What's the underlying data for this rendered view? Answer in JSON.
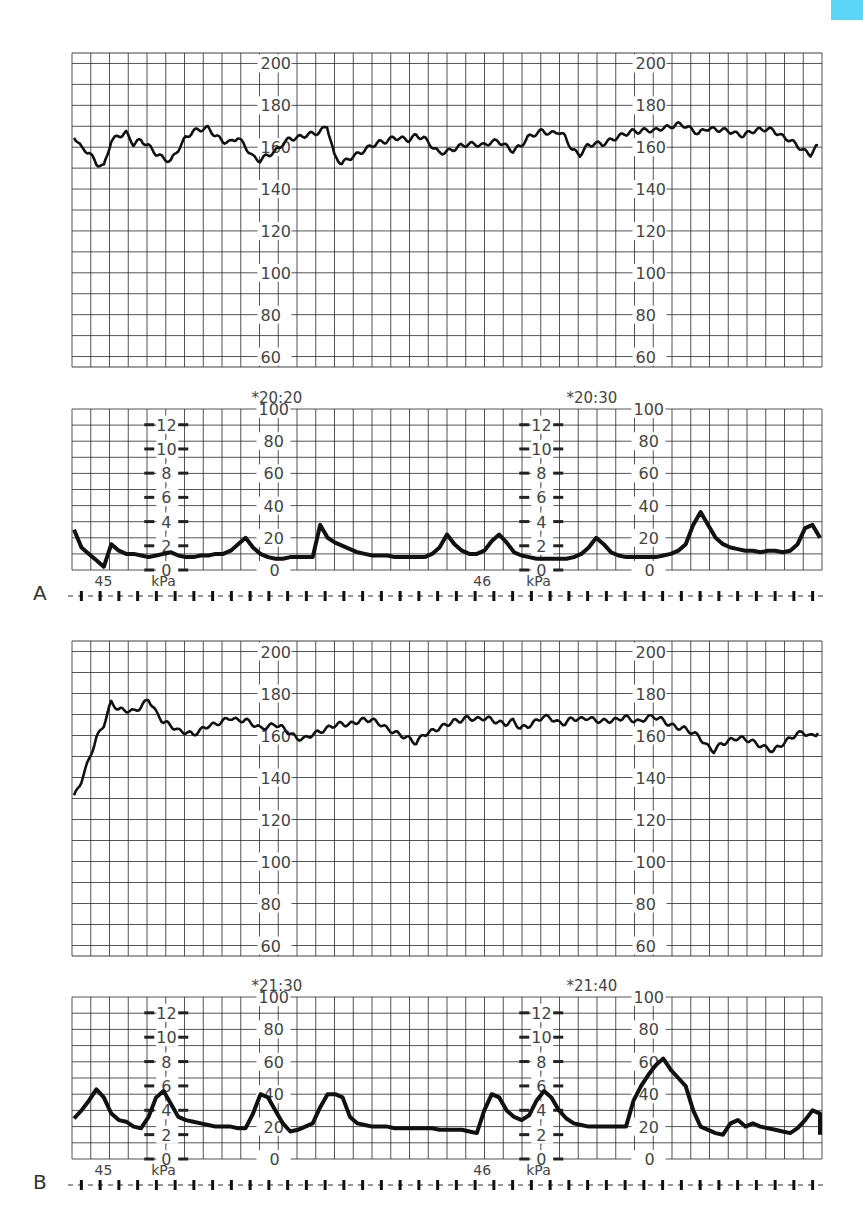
{
  "page": {
    "accent_tab_color": "#5ad5f5",
    "top_text": "",
    "grid_color": "#2a2a2a",
    "trace_color": "#111111",
    "label_color": "#444444"
  },
  "chart_data": [
    {
      "type": "line",
      "panel": "A",
      "title": "Panel A – Fetal heart rate (FHR)",
      "ylabel": "bpm",
      "ylim": [
        55,
        205
      ],
      "y_ticks": [
        200,
        180,
        160,
        140,
        120,
        100,
        80,
        60
      ],
      "grid": true,
      "x_domain": [
        0,
        100
      ],
      "series": [
        {
          "name": "FHR",
          "x": [
            0,
            1,
            2,
            3,
            4,
            5,
            6,
            7,
            8,
            9,
            10,
            11,
            12,
            13,
            14,
            15,
            16,
            17,
            18,
            19,
            20,
            21,
            22,
            23,
            24,
            25,
            26,
            27,
            28,
            29,
            30,
            31,
            32,
            33,
            34,
            35,
            36,
            37,
            38,
            39,
            40,
            41,
            42,
            43,
            44,
            45,
            46,
            47,
            48,
            49,
            50,
            51,
            52,
            53,
            54,
            55,
            56,
            57,
            58,
            59,
            60,
            61,
            62,
            63,
            64,
            65,
            66,
            67,
            68,
            69,
            70,
            71,
            72,
            73,
            74,
            75,
            76,
            77,
            78,
            79,
            80,
            81,
            82,
            83,
            84,
            85,
            86,
            87,
            88,
            89,
            90,
            91,
            92,
            93,
            94,
            95,
            96,
            97,
            98,
            99,
            100
          ],
          "values": [
            164,
            158,
            156,
            151,
            150,
            163,
            166,
            168,
            163,
            165,
            162,
            158,
            155,
            153,
            158,
            163,
            166,
            167,
            168,
            165,
            163,
            163,
            166,
            162,
            157,
            155,
            157,
            158,
            161,
            163,
            163,
            164,
            165,
            166,
            170,
            156,
            153,
            156,
            158,
            160,
            162,
            163,
            163,
            164,
            163,
            162,
            164,
            163,
            160,
            157,
            158,
            160,
            162,
            163,
            163,
            162,
            163,
            163,
            160,
            157,
            159,
            163,
            165,
            167,
            166,
            168,
            166,
            160,
            158,
            162,
            163,
            162,
            163,
            164,
            165,
            166,
            166,
            167,
            167,
            169,
            170,
            172,
            172,
            170,
            168,
            170,
            169,
            168,
            167,
            165,
            164,
            166,
            167,
            168,
            168,
            166,
            165,
            163,
            160,
            158,
            162
          ]
        }
      ],
      "annotations": []
    },
    {
      "type": "line",
      "panel": "A",
      "title": "Panel A – Uterine contractions (UC)",
      "ylabel": "mmHg / kPa",
      "ylim": [
        0,
        100
      ],
      "y_ticks": [
        100,
        80,
        60,
        40,
        20,
        0
      ],
      "kpa_ticks": [
        12,
        10,
        8,
        6,
        4,
        2,
        0
      ],
      "kpa_label": "kPa",
      "grid": true,
      "x_domain": [
        0,
        100
      ],
      "time_markers": [
        "*20:20",
        "*20:30"
      ],
      "page_markers": [
        "45",
        "46"
      ],
      "series": [
        {
          "name": "UC",
          "x": [
            0,
            1,
            2,
            3,
            4,
            5,
            6,
            7,
            8,
            9,
            10,
            11,
            12,
            13,
            14,
            15,
            16,
            17,
            18,
            19,
            20,
            21,
            22,
            23,
            24,
            25,
            26,
            27,
            28,
            29,
            30,
            31,
            32,
            33,
            34,
            35,
            36,
            37,
            38,
            39,
            40,
            41,
            42,
            43,
            44,
            45,
            46,
            47,
            48,
            49,
            50,
            51,
            52,
            53,
            54,
            55,
            56,
            57,
            58,
            59,
            60,
            61,
            62,
            63,
            64,
            65,
            66,
            67,
            68,
            69,
            70,
            71,
            72,
            73,
            74,
            75,
            76,
            77,
            78,
            79,
            80,
            81,
            82,
            83,
            84,
            85,
            86,
            87,
            88,
            89,
            90,
            91,
            92,
            93,
            94,
            95,
            96,
            97,
            98,
            99,
            100
          ],
          "values": [
            25,
            14,
            10,
            6,
            2,
            16,
            12,
            10,
            10,
            9,
            8,
            9,
            10,
            11,
            9,
            8,
            8,
            9,
            9,
            10,
            10,
            12,
            16,
            20,
            14,
            10,
            8,
            7,
            7,
            8,
            8,
            8,
            8,
            28,
            20,
            17,
            15,
            13,
            11,
            10,
            9,
            9,
            9,
            8,
            8,
            8,
            8,
            8,
            10,
            14,
            22,
            16,
            12,
            10,
            10,
            12,
            18,
            22,
            17,
            11,
            9,
            8,
            7,
            7,
            7,
            7,
            7,
            8,
            10,
            14,
            20,
            16,
            11,
            9,
            8,
            8,
            8,
            8,
            8,
            9,
            10,
            12,
            16,
            28,
            36,
            28,
            20,
            16,
            14,
            13,
            12,
            12,
            11,
            12,
            12,
            11,
            12,
            16,
            26,
            28,
            20
          ]
        }
      ],
      "annotations": [
        "*20:20",
        "*20:30"
      ]
    },
    {
      "type": "line",
      "panel": "B",
      "title": "Panel B – Fetal heart rate (FHR)",
      "ylabel": "bpm",
      "ylim": [
        55,
        205
      ],
      "y_ticks": [
        200,
        180,
        160,
        140,
        120,
        100,
        80,
        60
      ],
      "grid": true,
      "x_domain": [
        0,
        100
      ],
      "series": [
        {
          "name": "FHR",
          "x": [
            0,
            1,
            2,
            3,
            4,
            5,
            6,
            7,
            8,
            9,
            10,
            11,
            12,
            13,
            14,
            15,
            16,
            17,
            18,
            19,
            20,
            21,
            22,
            23,
            24,
            25,
            26,
            27,
            28,
            29,
            30,
            31,
            32,
            33,
            34,
            35,
            36,
            37,
            38,
            39,
            40,
            41,
            42,
            43,
            44,
            45,
            46,
            47,
            48,
            49,
            50,
            51,
            52,
            53,
            54,
            55,
            56,
            57,
            58,
            59,
            60,
            61,
            62,
            63,
            64,
            65,
            66,
            67,
            68,
            69,
            70,
            71,
            72,
            73,
            74,
            75,
            76,
            77,
            78,
            79,
            80,
            81,
            82,
            83,
            84,
            85,
            86,
            87,
            88,
            89,
            90,
            91,
            92,
            93,
            94,
            95,
            96,
            97,
            98,
            99,
            100
          ],
          "values": [
            132,
            140,
            150,
            160,
            166,
            176,
            172,
            171,
            170,
            172,
            176,
            170,
            166,
            165,
            163,
            163,
            162,
            164,
            166,
            166,
            167,
            168,
            166,
            166,
            164,
            162,
            163,
            165,
            164,
            162,
            160,
            160,
            162,
            163,
            164,
            165,
            165,
            164,
            165,
            166,
            166,
            165,
            163,
            162,
            161,
            160,
            158,
            162,
            163,
            164,
            165,
            166,
            166,
            167,
            166,
            167,
            167,
            166,
            166,
            168,
            165,
            166,
            168,
            170,
            169,
            166,
            165,
            167,
            166,
            167,
            166,
            166,
            167,
            168,
            170,
            169,
            168,
            170,
            170,
            168,
            165,
            163,
            162,
            160,
            158,
            154,
            152,
            156,
            158,
            160,
            160,
            159,
            157,
            155,
            153,
            155,
            157,
            159,
            160,
            158,
            160
          ]
        }
      ],
      "annotations": []
    },
    {
      "type": "line",
      "panel": "B",
      "title": "Panel B – Uterine contractions (UC)",
      "ylabel": "mmHg / kPa",
      "ylim": [
        0,
        100
      ],
      "y_ticks": [
        100,
        80,
        60,
        40,
        20,
        0
      ],
      "kpa_ticks": [
        12,
        10,
        8,
        6,
        4,
        2,
        0
      ],
      "kpa_label": "kPa",
      "grid": true,
      "x_domain": [
        0,
        100
      ],
      "time_markers": [
        "*21:30",
        "*21:40"
      ],
      "page_markers": [
        "45",
        "46"
      ],
      "series": [
        {
          "name": "UC",
          "x": [
            0,
            1,
            2,
            3,
            4,
            5,
            6,
            7,
            8,
            9,
            10,
            11,
            12,
            13,
            14,
            15,
            16,
            17,
            18,
            19,
            20,
            21,
            22,
            23,
            24,
            25,
            26,
            27,
            28,
            29,
            30,
            31,
            32,
            33,
            34,
            35,
            36,
            37,
            38,
            39,
            40,
            41,
            42,
            43,
            44,
            45,
            46,
            47,
            48,
            49,
            50,
            51,
            52,
            53,
            54,
            55,
            56,
            57,
            58,
            59,
            60,
            61,
            62,
            63,
            64,
            65,
            66,
            67,
            68,
            69,
            70,
            71,
            72,
            73,
            74,
            75,
            76,
            77,
            78,
            79,
            80,
            81,
            82,
            83,
            84,
            85,
            86,
            87,
            88,
            89,
            90,
            91,
            92,
            93,
            94,
            95,
            96,
            97,
            98,
            99,
            100
          ],
          "values": [
            25,
            30,
            36,
            43,
            38,
            28,
            24,
            23,
            20,
            19,
            26,
            38,
            42,
            34,
            26,
            24,
            23,
            22,
            21,
            20,
            20,
            20,
            19,
            19,
            28,
            40,
            38,
            30,
            22,
            17,
            18,
            20,
            22,
            32,
            40,
            40,
            38,
            26,
            22,
            21,
            20,
            20,
            20,
            19,
            19,
            19,
            19,
            19,
            19,
            18,
            18,
            18,
            18,
            17,
            16,
            30,
            40,
            38,
            30,
            26,
            24,
            27,
            36,
            42,
            38,
            30,
            25,
            22,
            21,
            20,
            20,
            20,
            20,
            20,
            20,
            36,
            45,
            52,
            58,
            62,
            55,
            50,
            45,
            30,
            20,
            18,
            16,
            15,
            22,
            24,
            20,
            22,
            20,
            19,
            18,
            17,
            16,
            19,
            24,
            30,
            28,
            25,
            22,
            18,
            15
          ]
        }
      ],
      "annotations": [
        "*21:30",
        "*21:40"
      ]
    }
  ],
  "panels": [
    {
      "label": "A",
      "fhr": {
        "left_axis_labels": [
          "200",
          "180",
          "160",
          "140",
          "120",
          "100",
          "80",
          "60"
        ],
        "right_axis_labels": [
          "200",
          "180",
          "160",
          "140",
          "120",
          "100",
          "80",
          "60"
        ]
      },
      "uc": {
        "time_left": "*20:20",
        "time_right": "*20:30",
        "mmhg_labels": [
          "100",
          "80",
          "60",
          "40",
          "20",
          "0"
        ],
        "kpa_labels": [
          "12",
          "10",
          "8",
          "6",
          "4",
          "2",
          "0"
        ],
        "kpa_unit": "kPa",
        "page_left": "45",
        "page_right": "46"
      }
    },
    {
      "label": "B",
      "fhr": {
        "left_axis_labels": [
          "200",
          "180",
          "160",
          "140",
          "120",
          "100",
          "80",
          "60"
        ],
        "right_axis_labels": [
          "200",
          "180",
          "160",
          "140",
          "120",
          "100",
          "80",
          "60"
        ]
      },
      "uc": {
        "time_left": "*21:30",
        "time_right": "*21:40",
        "mmhg_labels": [
          "100",
          "80",
          "60",
          "40",
          "20",
          "0"
        ],
        "kpa_labels": [
          "12",
          "10",
          "8",
          "6",
          "4",
          "2",
          "0"
        ],
        "kpa_unit": "kPa",
        "page_left": "45",
        "page_right": "46"
      }
    }
  ]
}
